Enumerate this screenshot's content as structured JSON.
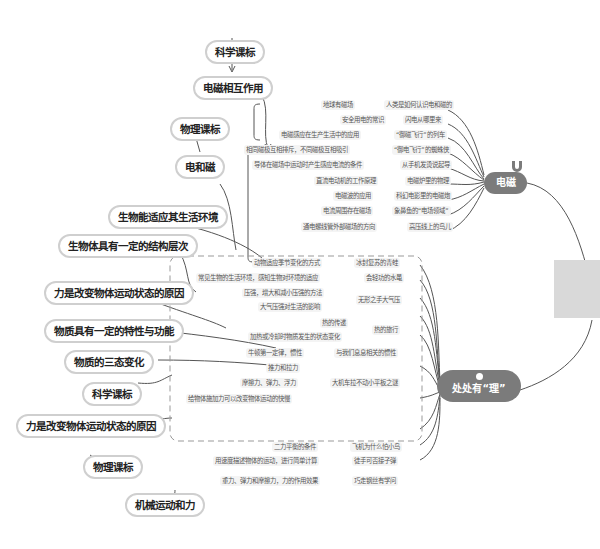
{
  "root": {
    "label": "处处有“理”",
    "icon": "lightbulb-icon"
  },
  "topic_electromagnetism": {
    "label": "电磁",
    "icon": "magnet-icon"
  },
  "side_tab": {
    "color": "#d9d9d9"
  },
  "colors": {
    "center_fill": "#7b7b7b",
    "pill_border": "#cfcfcf",
    "line": "#555555",
    "dash": "#999999"
  },
  "curriculum": {
    "c1": "科学课标",
    "c2": "电磁相互作用",
    "c3": "物理课标",
    "c4": "电和磁",
    "c5": "生物能适应其生活环境",
    "c6": "生物体具有一定的结构层次",
    "c7": "力是改变物体运动状态的原因",
    "c8": "物质具有一定的特性与功能",
    "c9": "物质的三态变化",
    "c10": "科学课标",
    "c11": "力是改变物体运动状态的原因",
    "c12": "物理课标",
    "c13": "机械运动和力"
  },
  "em_items": [
    {
      "left": "地球有磁场",
      "right": "人类是如何认识电和磁的"
    },
    {
      "left": "安全用电的常识",
      "right": "闪电从哪里来"
    },
    {
      "left": "电磁感应在生产生活中的应用",
      "right": "“御磁飞行”的列车"
    },
    {
      "left": "相同磁极互相排斥，不同磁极互相吸引",
      "right": "“御电飞行”的蜘蛛侠"
    },
    {
      "left": "导体在磁场中运动时产生感应电流的条件",
      "right": "从手机发烫说起导"
    },
    {
      "left": "直流电动机的工作原理",
      "right": "电磁炉里的物理"
    },
    {
      "left": "电磁波的应用",
      "right": "科幻电影里的电磁炮"
    },
    {
      "left": "电流周围存在磁场",
      "right": "象鼻鱼的“电场领域”"
    },
    {
      "left": "通电螺线管外部磁场的方向",
      "right": "高压线上的鸟儿"
    }
  ],
  "li_items": [
    {
      "left": "动物适应季节变化的方式",
      "right": "冰封复苏的青蛙"
    },
    {
      "left": "常见生物的生活环境，感知生物对环境的适应",
      "right": "会轻功的水黾"
    },
    {
      "left": [
        "压强，增大和减小压强的方法",
        "大气压强对生活的影响"
      ],
      "right": "无形之手大气压"
    },
    {
      "left": [
        "热的传递",
        "加热或冷却时物质发生的状态变化"
      ],
      "right": "热的旅行"
    },
    {
      "left": "牛顿第一定律，惯性",
      "right": "与我们息息相关的惯性"
    },
    {
      "left": [
        "推力和拉力",
        "摩擦力、弹力、浮力",
        "给物体施加力可以改变物体运动的快慢"
      ],
      "right": "大机车拉不动小平板之谜"
    },
    {
      "left": "二力平衡的条件",
      "right": "飞机为什么怕小鸟"
    },
    {
      "left": "用速度描述物体的运动，进行简单计算",
      "right": "徒手可否接子弹"
    },
    {
      "left": "重力、弹力和摩擦力，力的作用效果",
      "right": "巧走钢丝有学问"
    }
  ]
}
